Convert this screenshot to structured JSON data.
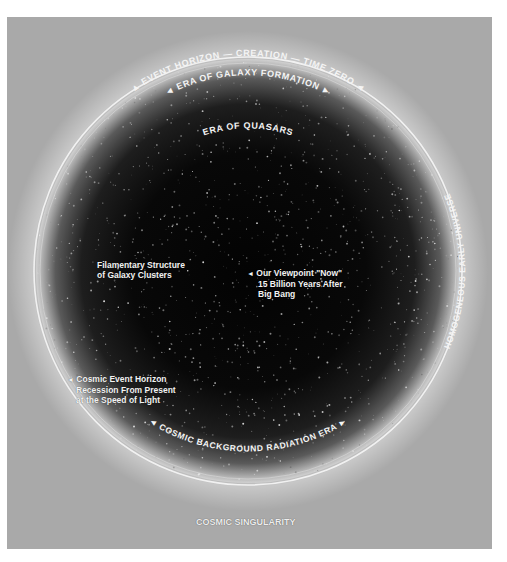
{
  "diagram": {
    "arc_labels": {
      "outer_top": "EVENT HORIZON — CREATION — TIME ZERO",
      "inner_top": "ERA OF GALAXY FORMATION",
      "quasars": "ERA OF QUASARS",
      "right": "HOMOGENEOUS EARLY UNIVERSE",
      "bottom": "COSMIC BACKGROUND RADIATION ERA"
    },
    "labels": {
      "filamentary": [
        "Filamentary Structure",
        "of Galaxy Clusters"
      ],
      "viewpoint": [
        "Our Viewpoint \"Now\"",
        "15 Billion Years After",
        "Big Bang"
      ],
      "horizon_recession": [
        "Cosmic Event Horizon",
        "Recession From Present",
        "at the Speed of Light"
      ],
      "singularity": "COSMIC SINGULARITY"
    },
    "arrow_glyph": "◄",
    "colors": {
      "background": "#a9a9a9",
      "core": "#050505",
      "ring": "#f6f6f6",
      "text": "#f2f2f2"
    }
  }
}
